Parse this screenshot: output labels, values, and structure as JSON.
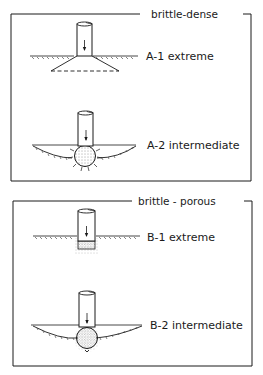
{
  "panels": [
    {
      "title": "brittle-dense",
      "cases": [
        {
          "label": "A-1 extreme"
        },
        {
          "label": "A-2 intermediate"
        }
      ]
    },
    {
      "title": "brittle - porous",
      "cases": [
        {
          "label": "B-1 extreme"
        },
        {
          "label": "B-2 intermediate"
        }
      ]
    }
  ],
  "colors": {
    "ink": "#1a1a1a",
    "background": "#ffffff"
  }
}
